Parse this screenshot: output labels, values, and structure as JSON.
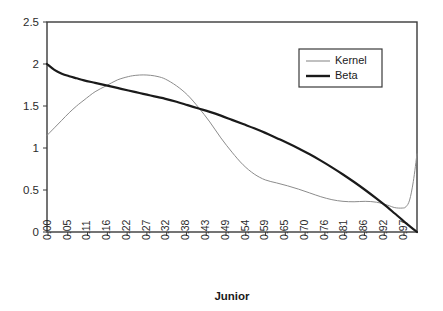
{
  "chart_data": {
    "type": "line",
    "title": "",
    "xlabel": "Junior",
    "ylabel": "",
    "xlim": [
      0,
      1
    ],
    "ylim": [
      0,
      2.5
    ],
    "grid": false,
    "legend_position": "top-right",
    "ytick_labels": [
      "2.5",
      "2",
      "1.5",
      "1",
      "0.5",
      "0"
    ],
    "ytick_values": [
      2.5,
      2,
      1.5,
      1,
      0.5,
      0
    ],
    "xtick_labels": [
      "0.00",
      "0.05",
      "0.11",
      "0.16",
      "0.22",
      "0.27",
      "0.32",
      "0.38",
      "0.43",
      "0.49",
      "0.54",
      "0.59",
      "0.65",
      "0.70",
      "0.76",
      "0.81",
      "0.86",
      "0.92",
      "0.97"
    ],
    "xtick_values": [
      0.0,
      0.05,
      0.11,
      0.16,
      0.22,
      0.27,
      0.32,
      0.38,
      0.43,
      0.49,
      0.54,
      0.59,
      0.65,
      0.7,
      0.76,
      0.81,
      0.86,
      0.92,
      0.97
    ],
    "x": [
      0.0,
      0.02,
      0.04,
      0.06,
      0.08,
      0.1,
      0.13,
      0.16,
      0.19,
      0.22,
      0.24,
      0.26,
      0.28,
      0.3,
      0.32,
      0.35,
      0.38,
      0.41,
      0.44,
      0.47,
      0.5,
      0.53,
      0.56,
      0.59,
      0.62,
      0.65,
      0.68,
      0.71,
      0.74,
      0.77,
      0.8,
      0.83,
      0.86,
      0.89,
      0.92,
      0.94,
      0.96,
      0.97,
      0.98,
      0.99,
      1.0
    ],
    "series": [
      {
        "name": "Kernel",
        "color": "#8c8c8c",
        "width": 1.0,
        "values": [
          1.15,
          1.24,
          1.33,
          1.42,
          1.5,
          1.57,
          1.67,
          1.74,
          1.81,
          1.85,
          1.865,
          1.87,
          1.865,
          1.85,
          1.82,
          1.74,
          1.63,
          1.48,
          1.31,
          1.12,
          0.95,
          0.8,
          0.69,
          0.62,
          0.585,
          0.55,
          0.51,
          0.465,
          0.42,
          0.385,
          0.365,
          0.36,
          0.365,
          0.355,
          0.32,
          0.29,
          0.285,
          0.3,
          0.38,
          0.6,
          0.93
        ]
      },
      {
        "name": "Beta",
        "color": "#1a1a1a",
        "width": 2.2,
        "values": [
          2.0,
          1.93,
          1.885,
          1.855,
          1.83,
          1.805,
          1.775,
          1.745,
          1.715,
          1.685,
          1.665,
          1.645,
          1.625,
          1.605,
          1.585,
          1.55,
          1.51,
          1.47,
          1.43,
          1.385,
          1.335,
          1.285,
          1.235,
          1.18,
          1.12,
          1.06,
          0.995,
          0.925,
          0.85,
          0.77,
          0.685,
          0.595,
          0.5,
          0.4,
          0.295,
          0.22,
          0.145,
          0.105,
          0.07,
          0.035,
          0.0
        ]
      }
    ]
  },
  "legend": {
    "entries": [
      {
        "label": "Kernel"
      },
      {
        "label": "Beta"
      }
    ]
  },
  "axis": {
    "x_title": "Junior"
  }
}
